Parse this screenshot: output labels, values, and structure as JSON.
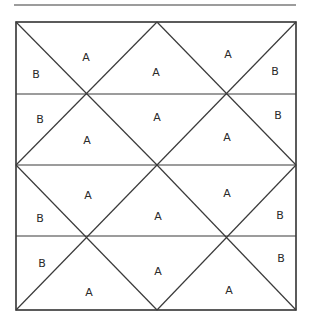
{
  "diagram": {
    "type": "tiled-triangle-grid",
    "rows": 4,
    "top_rule": {
      "x1": 14,
      "y1": 5,
      "x2": 296,
      "y2": 5
    },
    "frame": {
      "x": 16,
      "y": 22,
      "width": 280,
      "height": 288
    },
    "row_dividers_y": [
      94,
      165,
      236
    ],
    "labels": [
      {
        "text": "A",
        "x": 86,
        "y": 58
      },
      {
        "text": "B",
        "x": 36,
        "y": 75
      },
      {
        "text": "A",
        "x": 156,
        "y": 73
      },
      {
        "text": "A",
        "x": 228,
        "y": 55
      },
      {
        "text": "B",
        "x": 275,
        "y": 72
      },
      {
        "text": "B",
        "x": 40,
        "y": 120
      },
      {
        "text": "A",
        "x": 157,
        "y": 118
      },
      {
        "text": "B",
        "x": 278,
        "y": 116
      },
      {
        "text": "A",
        "x": 87,
        "y": 141
      },
      {
        "text": "A",
        "x": 227,
        "y": 138
      },
      {
        "text": "A",
        "x": 88,
        "y": 196
      },
      {
        "text": "A",
        "x": 227,
        "y": 194
      },
      {
        "text": "B",
        "x": 40,
        "y": 219
      },
      {
        "text": "A",
        "x": 158,
        "y": 217
      },
      {
        "text": "B",
        "x": 280,
        "y": 216
      },
      {
        "text": "B",
        "x": 42,
        "y": 264
      },
      {
        "text": "A",
        "x": 158,
        "y": 272
      },
      {
        "text": "B",
        "x": 281,
        "y": 259
      },
      {
        "text": "A",
        "x": 89,
        "y": 293
      },
      {
        "text": "A",
        "x": 229,
        "y": 291
      }
    ]
  }
}
